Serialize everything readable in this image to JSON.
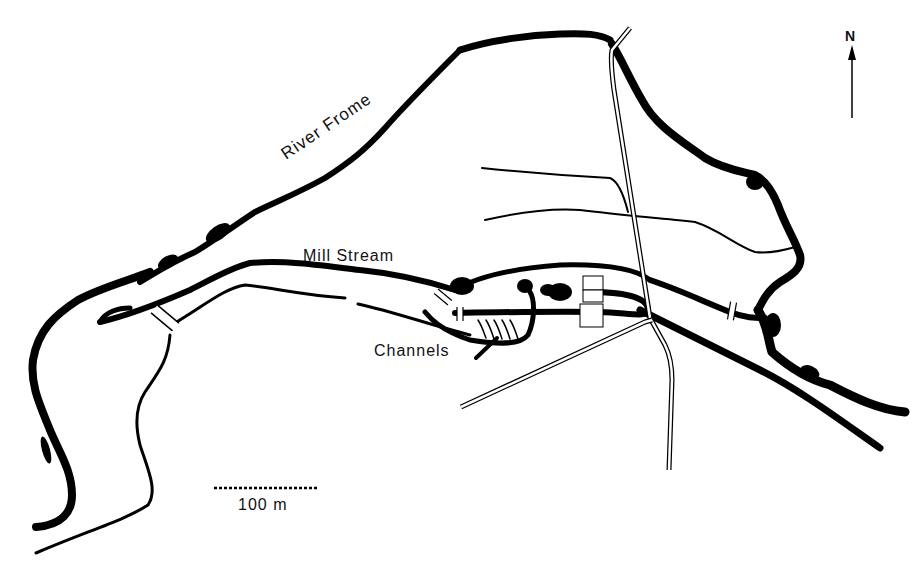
{
  "map": {
    "labels": {
      "river": "River Frome",
      "mill_stream": "Mill Stream",
      "channels": "Channels"
    },
    "north_arrow": {
      "label": "N"
    },
    "scale_bar": {
      "label": "100 m"
    },
    "colors": {
      "ink": "#000000",
      "background": "#ffffff"
    }
  }
}
